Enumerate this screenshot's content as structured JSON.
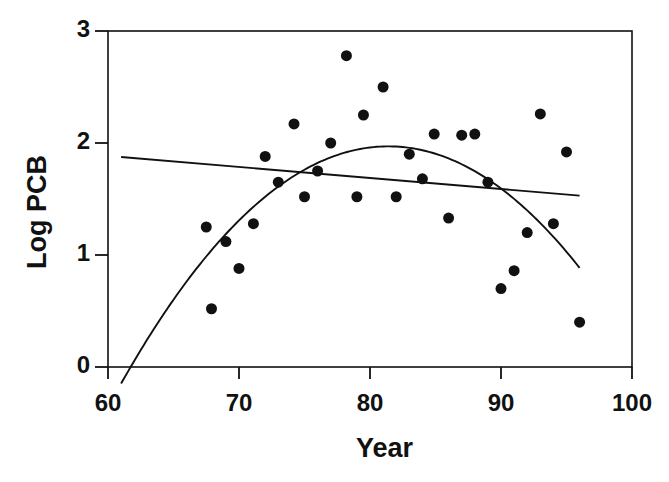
{
  "figure": {
    "background_color": "#ffffff",
    "ink_color": "#111111"
  },
  "chart_data": {
    "type": "scatter",
    "title": "",
    "subtitle": "",
    "xlabel": "Year",
    "ylabel": "Log PCB",
    "xlim": [
      60,
      100
    ],
    "ylim": [
      0,
      3
    ],
    "xticks": [
      60,
      70,
      80,
      90,
      100
    ],
    "yticks": [
      0,
      1,
      2,
      3
    ],
    "xtick_labels": [
      "60",
      "70",
      "80",
      "90",
      "100"
    ],
    "ytick_labels": [
      "0",
      "1",
      "2",
      "3"
    ],
    "grid": false,
    "legend": null,
    "legend_position": "none",
    "marker": {
      "shape": "filled-circle",
      "color": "#111111",
      "radius_px": 5.5
    },
    "points": [
      {
        "x": 67.5,
        "y": 1.25
      },
      {
        "x": 67.9,
        "y": 0.52
      },
      {
        "x": 69.0,
        "y": 1.12
      },
      {
        "x": 70.0,
        "y": 0.88
      },
      {
        "x": 71.1,
        "y": 1.28
      },
      {
        "x": 72.0,
        "y": 1.88
      },
      {
        "x": 73.0,
        "y": 1.65
      },
      {
        "x": 74.2,
        "y": 2.17
      },
      {
        "x": 75.0,
        "y": 1.52
      },
      {
        "x": 76.0,
        "y": 1.75
      },
      {
        "x": 77.0,
        "y": 2.0
      },
      {
        "x": 78.2,
        "y": 2.78
      },
      {
        "x": 79.0,
        "y": 1.52
      },
      {
        "x": 79.5,
        "y": 2.25
      },
      {
        "x": 81.0,
        "y": 2.5
      },
      {
        "x": 82.0,
        "y": 1.52
      },
      {
        "x": 83.0,
        "y": 1.9
      },
      {
        "x": 84.0,
        "y": 1.68
      },
      {
        "x": 84.9,
        "y": 2.08
      },
      {
        "x": 86.0,
        "y": 1.33
      },
      {
        "x": 87.0,
        "y": 2.07
      },
      {
        "x": 88.0,
        "y": 2.08
      },
      {
        "x": 89.0,
        "y": 1.65
      },
      {
        "x": 90.0,
        "y": 0.7
      },
      {
        "x": 91.0,
        "y": 0.86
      },
      {
        "x": 92.0,
        "y": 1.2
      },
      {
        "x": 93.0,
        "y": 2.26
      },
      {
        "x": 94.0,
        "y": 1.28
      },
      {
        "x": 95.0,
        "y": 1.92
      },
      {
        "x": 96.0,
        "y": 0.4
      }
    ],
    "fits": [
      {
        "name": "linear-fit",
        "kind": "line",
        "color": "#111111",
        "x_range": [
          61,
          96
        ],
        "endpoints": [
          {
            "x": 61,
            "y": 1.875
          },
          {
            "x": 96,
            "y": 1.53
          }
        ]
      },
      {
        "name": "quadratic-fit",
        "kind": "parabola",
        "color": "#111111",
        "x_range": [
          61,
          96
        ],
        "vertex": {
          "x": 81.4,
          "y": 1.97
        },
        "endpoints": [
          {
            "x": 61,
            "y": -0.06
          },
          {
            "x": 96,
            "y": 0.84
          }
        ]
      }
    ]
  }
}
